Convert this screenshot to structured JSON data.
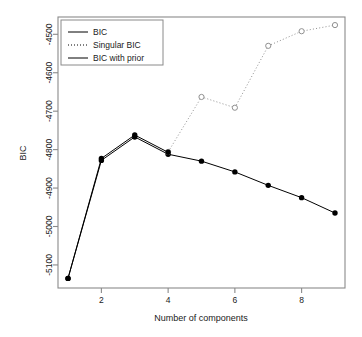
{
  "chart_data": {
    "type": "line",
    "title": "",
    "xlabel": "Number of components",
    "ylabel": "BIC",
    "x": [
      1,
      2,
      3,
      4,
      5,
      6,
      7,
      8,
      9
    ],
    "xlim": [
      0.7,
      9.3
    ],
    "ylim": [
      -5160,
      -4455
    ],
    "xticks": [
      2,
      4,
      6,
      8
    ],
    "xtick_labels": [
      "2",
      "4",
      "6",
      "8"
    ],
    "yticks": [
      -4500,
      -4600,
      -4700,
      -4800,
      -4900,
      -5000,
      -5100
    ],
    "ytick_labels": [
      "-4500",
      "-4600",
      "-4700",
      "-4800",
      "-4900",
      "-5000",
      "-5100"
    ],
    "grid": false,
    "legend_position": "top-left",
    "series": [
      {
        "name": "BIC",
        "style": "solid",
        "marker": "filled-circle",
        "color": "#000000",
        "x": [
          1,
          2,
          3,
          4,
          5,
          6,
          7,
          8,
          9
        ],
        "values": [
          -5135,
          -4828,
          -4767,
          -4812,
          -4830,
          -4858,
          -4893,
          -4925,
          -4965
        ]
      },
      {
        "name": "Singular BIC",
        "style": "dotted",
        "marker": "open-circle",
        "color": "#909090",
        "x": [
          4,
          5,
          6,
          7,
          8,
          9
        ],
        "values": [
          -4806,
          -4663,
          -4691,
          -4530,
          -4492,
          -4476
        ]
      },
      {
        "name": "BIC with prior",
        "style": "solid",
        "marker": "filled-circle",
        "color": "#000000",
        "x": [
          1,
          2,
          3,
          4
        ],
        "values": [
          -5135,
          -4823,
          -4762,
          -4807
        ]
      }
    ]
  },
  "legend": {
    "entries": [
      {
        "label": "BIC",
        "style": "solid"
      },
      {
        "label": "Singular BIC",
        "style": "dotted"
      },
      {
        "label": "BIC with prior",
        "style": "solid"
      }
    ]
  },
  "axes": {
    "x_title": "Number of components",
    "y_title": "BIC"
  }
}
